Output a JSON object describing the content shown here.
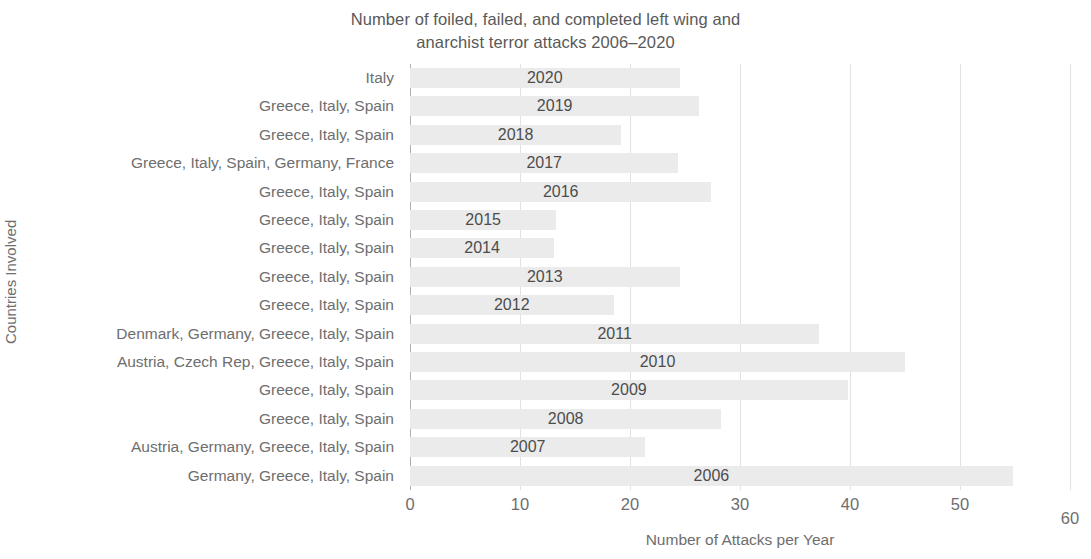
{
  "chart_data": {
    "type": "bar",
    "orientation": "horizontal",
    "title": "Number of foiled, failed, and completed left wing and anarchist terror attacks 2006–2020",
    "title_lines": [
      "Number of foiled, failed, and completed left wing and",
      "anarchist terror attacks 2006–2020"
    ],
    "xlabel": "Number of Attacks per Year",
    "ylabel": "Countries Involved",
    "xlim": [
      0,
      60
    ],
    "xticks": [
      0,
      10,
      20,
      30,
      40,
      50,
      60
    ],
    "xtick_labels": [
      "0",
      "10",
      "20",
      "30",
      "40",
      "50",
      "60"
    ],
    "grid": "vertical",
    "legend": "none",
    "bar_color": "#ebebeb",
    "label_color": "#4d4d4d",
    "axis_color": "#6e6e6e",
    "categories": [
      "Italy",
      "Greece, Italy, Spain",
      "Greece, Italy, Spain",
      "Greece, Italy, Spain, Germany, France",
      "Greece, Italy, Spain",
      "Greece, Italy, Spain",
      "Greece, Italy, Spain",
      "Greece, Italy, Spain",
      "Greece, Italy, Spain",
      "Denmark, Germany, Greece, Italy, Spain",
      "Austria, Czech Rep, Greece, Italy, Spain",
      "Greece, Italy, Spain",
      "Greece, Italy, Spain",
      "Austria, Germany, Greece, Italy, Spain",
      "Germany, Greece, Italy, Spain"
    ],
    "bar_labels": [
      "2020",
      "2019",
      "2018",
      "2017",
      "2016",
      "2015",
      "2014",
      "2013",
      "2012",
      "2011",
      "2010",
      "2009",
      "2008",
      "2007",
      "2006"
    ],
    "values": [
      24.5,
      26.3,
      19.2,
      24.4,
      27.4,
      13.3,
      13.1,
      24.5,
      18.5,
      37.2,
      45.0,
      39.8,
      28.3,
      21.4,
      54.8
    ]
  }
}
